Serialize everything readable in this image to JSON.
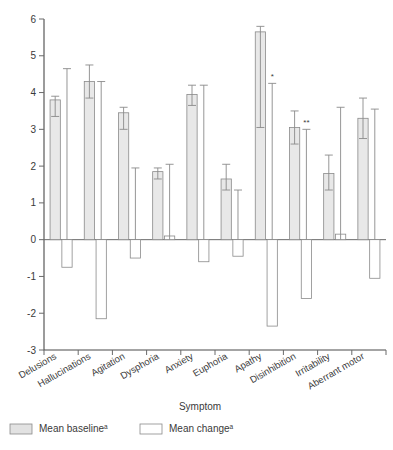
{
  "chart_data": {
    "type": "bar",
    "title": "",
    "xlabel": "Symptom",
    "ylabel": "",
    "ylim": [
      -3,
      6
    ],
    "yticks": [
      6,
      5,
      4,
      3,
      2,
      1,
      0,
      -1,
      -2,
      -3
    ],
    "ytick_labels": [
      "6",
      "5",
      "4",
      "3",
      "2",
      "1",
      "0",
      "-1",
      "-2",
      "-3"
    ],
    "grid": false,
    "legend_position": "bottom-left",
    "categories": [
      "Delusions",
      "Hallucinations",
      "Agitation",
      "Dysphoria",
      "Anxiety",
      "Euphoria",
      "Apathy",
      "Disinhibition",
      "Irritability",
      "Aberrant motor"
    ],
    "series": [
      {
        "name": "Mean baseline",
        "superscript": "a",
        "fill": "#e8e8e8",
        "values": [
          3.8,
          4.3,
          3.45,
          1.85,
          3.95,
          1.65,
          5.65,
          3.05,
          1.8,
          3.3
        ],
        "err_low": [
          3.35,
          3.85,
          3.0,
          1.65,
          3.65,
          1.35,
          3.05,
          2.6,
          1.35,
          2.75
        ],
        "err_high": [
          3.9,
          4.75,
          3.6,
          1.95,
          4.2,
          2.05,
          5.8,
          3.5,
          2.3,
          3.85
        ]
      },
      {
        "name": "Mean change",
        "superscript": "a",
        "fill": "#ffffff",
        "values": [
          -0.75,
          -2.15,
          -0.5,
          0.1,
          -0.6,
          -0.45,
          -2.35,
          -1.6,
          0.15,
          -1.05
        ],
        "err_low": [
          null,
          null,
          null,
          null,
          null,
          null,
          null,
          null,
          null,
          null
        ],
        "err_high": [
          4.65,
          4.3,
          1.95,
          2.05,
          4.2,
          1.35,
          4.25,
          3.0,
          3.6,
          3.55
        ]
      }
    ],
    "annotations": [
      {
        "text": "*",
        "category": "Apathy",
        "series": "Mean change"
      },
      {
        "text": "**",
        "category": "Disinhibition",
        "series": "Mean change"
      }
    ]
  },
  "legend": {
    "items": [
      {
        "label": "Mean baseline",
        "superscript": "a",
        "swatch": "gray-filled"
      },
      {
        "label": "Mean change",
        "superscript": "a",
        "swatch": "white-outline"
      }
    ]
  },
  "axis": {
    "x_title": "Symptom"
  }
}
